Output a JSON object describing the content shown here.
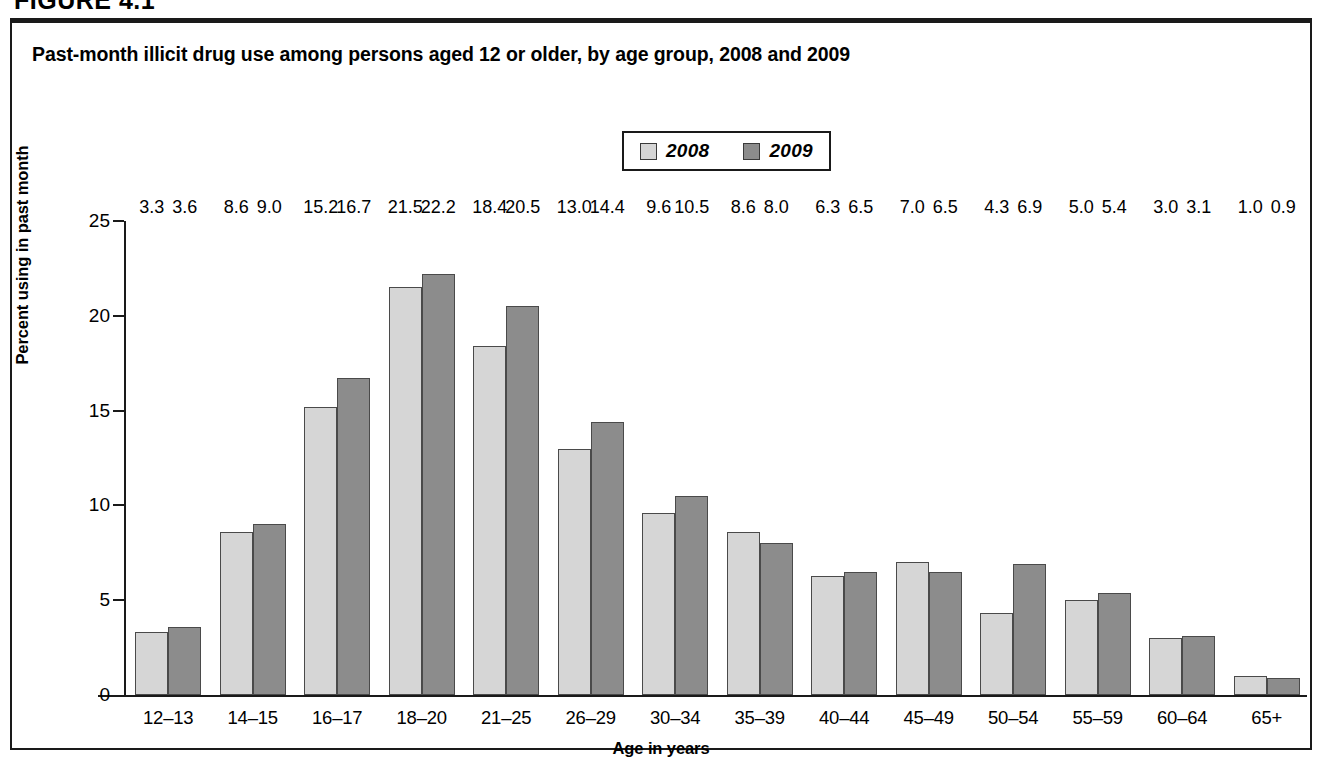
{
  "figure": {
    "number_label": "FIGURE 4.1",
    "title": "Past-month illicit drug use among persons aged 12 or older, by age group, 2008 and 2009"
  },
  "legend": {
    "entries": [
      {
        "label": "2008",
        "color": "#d6d6d6"
      },
      {
        "label": "2009",
        "color": "#8c8c8c"
      }
    ]
  },
  "axes": {
    "y_title": "Percent using in past month",
    "x_title": "Age in years",
    "y_ticks": [
      "0",
      "5",
      "10",
      "15",
      "20",
      "25"
    ]
  },
  "chart_data": {
    "type": "bar",
    "title": "Past-month illicit drug use among persons aged 12 or older, by age group, 2008 and 2009",
    "xlabel": "Age in years",
    "ylabel": "Percent using in past month",
    "ylim": [
      0,
      25
    ],
    "yticks": [
      0,
      5,
      10,
      15,
      20,
      25
    ],
    "grid": false,
    "legend_position": "top-center",
    "categories": [
      "12–13",
      "14–15",
      "16–17",
      "18–20",
      "21–25",
      "26–29",
      "30–34",
      "35–39",
      "40–44",
      "45–49",
      "50–54",
      "55–59",
      "60–64",
      "65+"
    ],
    "series": [
      {
        "name": "2008",
        "color": "#d6d6d6",
        "values": [
          3.3,
          8.6,
          15.2,
          21.5,
          18.4,
          13.0,
          9.6,
          8.6,
          6.3,
          7.0,
          4.3,
          5.0,
          3.0,
          1.0
        ],
        "labels": [
          "3.3",
          "8.6",
          "15.2",
          "21.5",
          "18.4",
          "13.0",
          "9.6",
          "8.6",
          "6.3",
          "7.0",
          "4.3",
          "5.0",
          "3.0",
          "1.0"
        ]
      },
      {
        "name": "2009",
        "color": "#8c8c8c",
        "values": [
          3.6,
          9.0,
          16.7,
          22.2,
          20.5,
          14.4,
          10.5,
          8.0,
          6.5,
          6.5,
          6.9,
          5.4,
          3.1,
          0.9
        ],
        "labels": [
          "3.6",
          "9.0",
          "16.7",
          "22.2",
          "20.5",
          "14.4",
          "10.5",
          "8.0",
          "6.5",
          "6.5",
          "6.9",
          "5.4",
          "3.1",
          "0.9"
        ]
      }
    ]
  }
}
